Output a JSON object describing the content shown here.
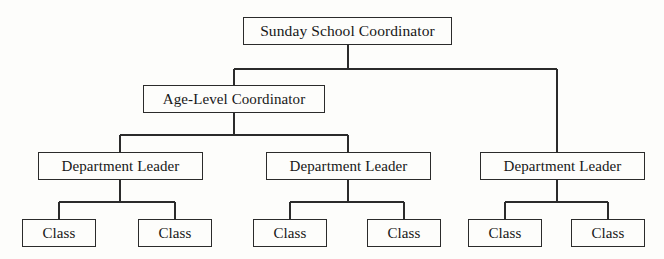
{
  "diagram": {
    "type": "organizational-hierarchy",
    "background_color": "#fdfdfb",
    "line_color": "#2b2b2b",
    "text_color": "#171717",
    "levels": [
      {
        "level": 1,
        "nodes": [
          {
            "id": "root",
            "label": "Sunday School Coordinator"
          }
        ]
      },
      {
        "level": 2,
        "nodes": [
          {
            "id": "age-level",
            "label": "Age-Level Coordinator"
          }
        ]
      },
      {
        "level": 3,
        "nodes": [
          {
            "id": "dept1",
            "label": "Department Leader"
          },
          {
            "id": "dept2",
            "label": "Department Leader"
          },
          {
            "id": "dept3",
            "label": "Department Leader"
          }
        ]
      },
      {
        "level": 4,
        "nodes": [
          {
            "id": "class1",
            "label": "Class"
          },
          {
            "id": "class2",
            "label": "Class"
          },
          {
            "id": "class3",
            "label": "Class"
          },
          {
            "id": "class4",
            "label": "Class"
          },
          {
            "id": "class5",
            "label": "Class"
          },
          {
            "id": "class6",
            "label": "Class"
          }
        ]
      }
    ],
    "edges": [
      {
        "from": "root",
        "to": "age-level"
      },
      {
        "from": "root",
        "to": "dept3"
      },
      {
        "from": "age-level",
        "to": "dept1"
      },
      {
        "from": "age-level",
        "to": "dept2"
      },
      {
        "from": "dept1",
        "to": "class1"
      },
      {
        "from": "dept1",
        "to": "class2"
      },
      {
        "from": "dept2",
        "to": "class3"
      },
      {
        "from": "dept2",
        "to": "class4"
      },
      {
        "from": "dept3",
        "to": "class5"
      },
      {
        "from": "dept3",
        "to": "class6"
      }
    ]
  }
}
